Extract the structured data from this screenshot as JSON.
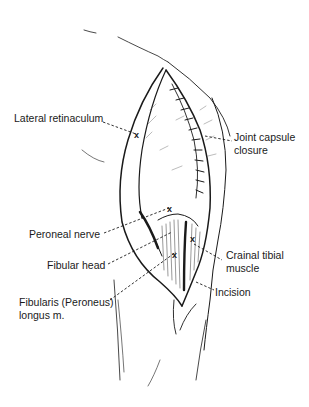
{
  "figure": {
    "background": "#ffffff",
    "line_color": "#1a1a1a"
  },
  "labels": {
    "lateral_retinaculum": "Lateral retinaculum",
    "joint_capsule_1": "Joint capsule",
    "joint_capsule_2": "closure",
    "peroneal_nerve": "Peroneal nerve",
    "fibular_head": "Fibular head",
    "fibularis_1": "Fibularis (Peroneus)",
    "fibularis_2": "longus m.",
    "cranial_tibial_1": "Crainal tibial",
    "cranial_tibial_2": "muscle",
    "incision": "Incision"
  },
  "markers": {
    "x_glyph": "x"
  }
}
